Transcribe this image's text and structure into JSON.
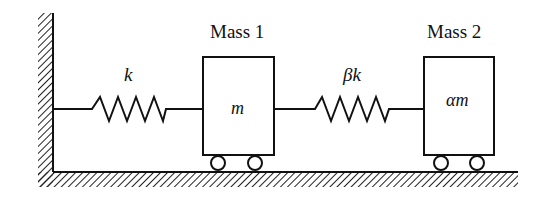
{
  "diagram": {
    "type": "two-mass spring system",
    "wall": {
      "side": "left",
      "hatched": true
    },
    "floor": {
      "hatched": true
    },
    "springs": [
      {
        "id": "spring-1",
        "label": "k",
        "connects": [
          "wall",
          "mass-1"
        ]
      },
      {
        "id": "spring-2",
        "label": "βk",
        "connects": [
          "mass-1",
          "mass-2"
        ]
      }
    ],
    "masses": [
      {
        "id": "mass-1",
        "title": "Mass 1",
        "value": "m",
        "wheels": 2
      },
      {
        "id": "mass-2",
        "title": "Mass 2",
        "value": "αm",
        "wheels": 2
      }
    ]
  },
  "colors": {
    "stroke": "#111111",
    "background": "#ffffff"
  }
}
